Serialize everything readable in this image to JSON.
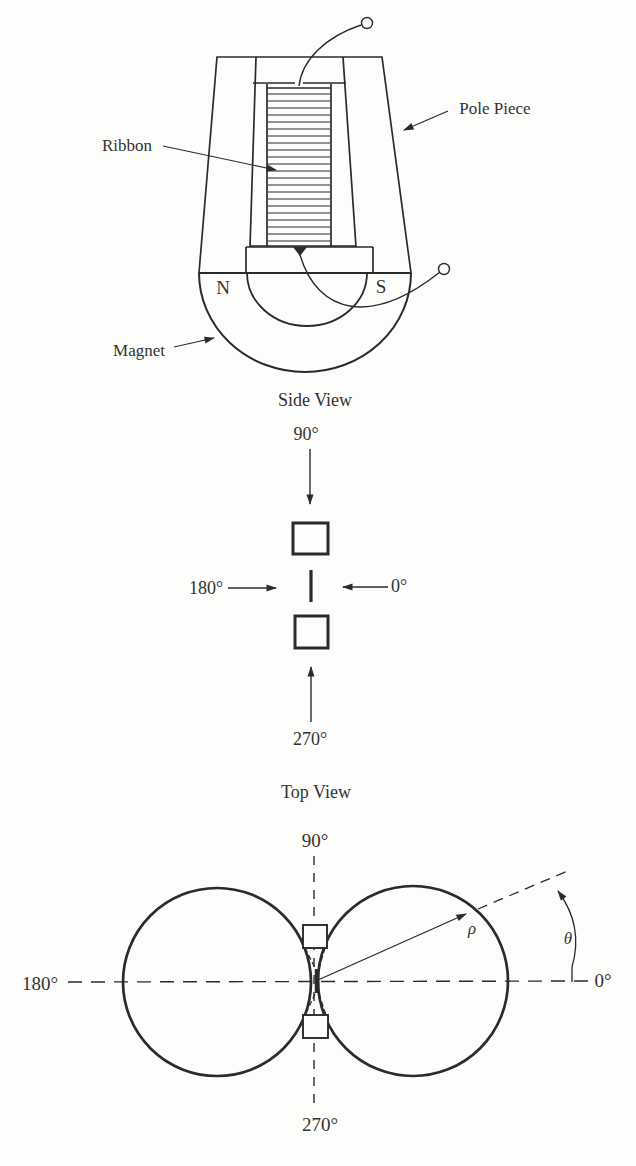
{
  "palette": {
    "ink": "#2b2b2b",
    "paper": "#fdfdfb",
    "text": "#333333"
  },
  "side_view": {
    "caption": "Side View",
    "labels": {
      "ribbon": "Ribbon",
      "pole_piece": "Pole Piece",
      "magnet": "Magnet"
    },
    "poles": {
      "north": "N",
      "south": "S"
    }
  },
  "top_view": {
    "caption": "Top View",
    "angles": {
      "top": "90°",
      "left": "180°",
      "right": "0°",
      "bottom": "270°"
    }
  },
  "polar_pattern": {
    "angles": {
      "top": "90°",
      "left": "180°",
      "right": "0°",
      "bottom": "270°"
    },
    "symbols": {
      "radius": "ρ",
      "angle": "θ"
    }
  }
}
